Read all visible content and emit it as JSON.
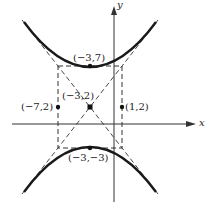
{
  "diagram": {
    "type": "hyperbola",
    "colors": {
      "curve": "#1a1a1a",
      "dashed": "#333333",
      "axis": "#333333",
      "text": "#222222"
    },
    "axes": {
      "x_label": "x",
      "y_label": "y"
    },
    "points": {
      "center": "(−3,2)",
      "vertex_top": "(−3,7)",
      "vertex_bottom": "(−3,−3)",
      "left": "(−7,2)",
      "right": "(1,2)"
    },
    "elements": [
      "upper branch",
      "lower branch",
      "asymptotes (dashed)",
      "central rectangle (dashed)"
    ]
  }
}
